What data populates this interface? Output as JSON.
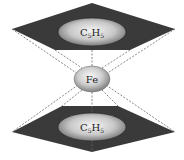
{
  "diagram": {
    "type": "ferrocene-sandwich-structure",
    "top_ring": {
      "label_base": "C",
      "label_sub1": "5",
      "label_mid": "H",
      "label_sub2": "5",
      "fill": "#3a3a3a"
    },
    "center_atom": {
      "label": "Fe"
    },
    "bottom_ring": {
      "label_base": "C",
      "label_sub1": "5",
      "label_mid": "H",
      "label_sub2": "5",
      "fill": "#3a3a3a"
    },
    "colors": {
      "plate": "#3a3a3a",
      "ellipse_light": "#f2f2f2",
      "ellipse_dark": "#7a7a7a",
      "bond_line": "#555555"
    }
  }
}
